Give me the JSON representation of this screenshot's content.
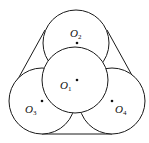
{
  "diagram": {
    "circles": [
      {
        "name": "O1",
        "cx": 75,
        "cy": 80,
        "r": 33
      },
      {
        "name": "O2",
        "cx": 76,
        "cy": 43,
        "r": 33
      },
      {
        "name": "O3",
        "cx": 42,
        "cy": 101,
        "r": 33
      },
      {
        "name": "O4",
        "cx": 112,
        "cy": 101,
        "r": 33
      }
    ],
    "labels": {
      "o1": {
        "main": "O",
        "sub": "1"
      },
      "o2": {
        "main": "O",
        "sub": "2"
      },
      "o3": {
        "main": "O",
        "sub": "3"
      },
      "o4": {
        "main": "O",
        "sub": "4"
      }
    },
    "stroke_color": "#1a1a1a"
  }
}
